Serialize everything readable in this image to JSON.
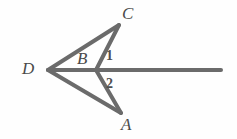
{
  "figure": {
    "background_color": "#fefefe",
    "stroke_color": "#6b6b6b",
    "label_color": "#4a4a4a",
    "stroke_width": 4,
    "vertex_labels": [
      {
        "name": "D",
        "text": "D",
        "x": 22,
        "y": 60,
        "style": "italic-serif"
      },
      {
        "name": "C",
        "text": "C",
        "x": 122,
        "y": 5,
        "style": "italic-serif"
      },
      {
        "name": "A",
        "text": "A",
        "x": 121,
        "y": 116,
        "style": "italic-serif"
      },
      {
        "name": "B",
        "text": "B",
        "x": 77,
        "y": 50,
        "style": "italic-serif"
      }
    ],
    "angle_labels": [
      {
        "name": "angle-1",
        "text": "1",
        "x": 106,
        "y": 49
      },
      {
        "name": "angle-2",
        "text": "2",
        "x": 106,
        "y": 77
      }
    ],
    "points": {
      "D": {
        "x": 48,
        "y": 70
      },
      "B": {
        "x": 96,
        "y": 70
      },
      "C": {
        "x": 119,
        "y": 25
      },
      "A": {
        "x": 121,
        "y": 113
      },
      "ray_end": {
        "x": 221,
        "y": 70
      }
    },
    "segments": [
      {
        "name": "segment-D-C",
        "from": "D",
        "to": "C"
      },
      {
        "name": "segment-D-A",
        "from": "D",
        "to": "A"
      },
      {
        "name": "segment-B-C",
        "from": "B",
        "to": "C"
      },
      {
        "name": "segment-B-A",
        "from": "B",
        "to": "A"
      },
      {
        "name": "ray-D-right",
        "from": "D",
        "to": "ray_end"
      }
    ]
  }
}
